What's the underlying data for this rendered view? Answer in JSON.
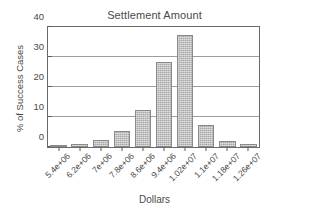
{
  "chart_data": {
    "type": "bar",
    "title": "Settlement Amount",
    "xlabel": "Dollars",
    "ylabel": "% of Success Cases",
    "categories": [
      "5.4e+06",
      "6.2e+06",
      "7e+06",
      "7.8e+06",
      "8.6e+06",
      "9.4e+06",
      "1.02e+07",
      "1.1e+07",
      "1.18e+07",
      "1.26e+07"
    ],
    "values": [
      0.6,
      1.0,
      2.2,
      5.5,
      12.4,
      28.3,
      37.4,
      7.5,
      2.0,
      1.0
    ],
    "ylim": [
      0,
      40
    ],
    "yticks": [
      0,
      10,
      20,
      30,
      40
    ],
    "ytick_labels": [
      "0",
      "10",
      "20",
      "30",
      "40"
    ],
    "grid": true,
    "legend": false,
    "bar_color": "#a9a9a9",
    "bar_edge_color": "#8a8a8a",
    "axis_color": "#6a6a6a"
  }
}
